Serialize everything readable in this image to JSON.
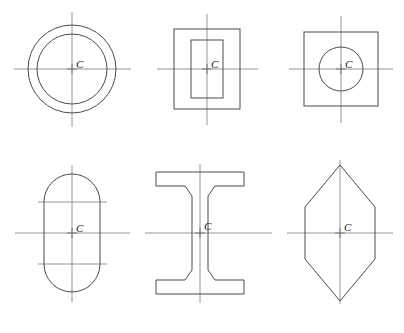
{
  "figure": {
    "background_color": "#ffffff",
    "outline_color": "#4a4a4a",
    "centerline_color": "#8a8a8a",
    "label_color": "#1a1a1a",
    "width": 404,
    "height": 333,
    "rows": 2,
    "columns": 3
  },
  "shapes": [
    {
      "id": "annulus",
      "name": "Hollow circle (annulus)",
      "centroid_label": "C",
      "center": {
        "x": 72,
        "y": 69
      },
      "outer_radius": 44,
      "inner_radius": 35,
      "label_offset": {
        "x": 4,
        "y": -1
      },
      "centerlines": {
        "horizontal": [
          {
            "x1": 14,
            "x2": 131,
            "y": 69
          }
        ],
        "vertical": [
          {
            "y1": 12,
            "y2": 127,
            "x": 72
          }
        ]
      }
    },
    {
      "id": "hollow-rectangle",
      "name": "Hollow rectangular tube",
      "centroid_label": "C",
      "center": {
        "x": 207,
        "y": 69
      },
      "outer_width": 66,
      "outer_height": 80,
      "inner_width": 32,
      "inner_height": 58,
      "label_offset": {
        "x": 4,
        "y": -1
      },
      "centerlines": {
        "horizontal": [
          {
            "x1": 157,
            "x2": 258,
            "y": 69
          }
        ],
        "vertical": [
          {
            "y1": 14,
            "y2": 125,
            "x": 207
          }
        ]
      }
    },
    {
      "id": "square-with-hole",
      "name": "Square with central circular hole",
      "centroid_label": "C",
      "center": {
        "x": 341,
        "y": 69
      },
      "square_size": 74,
      "hole_radius": 22,
      "label_offset": {
        "x": 4,
        "y": -1
      },
      "centerlines": {
        "horizontal": [
          {
            "x1": 289,
            "x2": 393,
            "y": 69
          }
        ],
        "vertical": [
          {
            "y1": 16,
            "y2": 123,
            "x": 341
          }
        ]
      }
    },
    {
      "id": "stadium",
      "name": "Obround (stadium) section",
      "centroid_label": "C",
      "center": {
        "x": 72,
        "y": 233
      },
      "body_width": 56,
      "body_height": 118,
      "corner_radius": 28,
      "label_offset": {
        "x": 4,
        "y": -1
      },
      "centerlines": {
        "horizontal": [
          {
            "x1": 15,
            "x2": 130,
            "y": 233
          },
          {
            "x1": 38,
            "x2": 107,
            "y": 202
          },
          {
            "x1": 38,
            "x2": 107,
            "y": 264
          }
        ],
        "vertical": [
          {
            "y1": 165,
            "y2": 302,
            "x": 72
          }
        ]
      }
    },
    {
      "id": "i-beam",
      "name": "Wide-flange I-beam section",
      "centroid_label": "C",
      "center": {
        "x": 200,
        "y": 233
      },
      "flange_width": 88,
      "flange_thickness": 14,
      "web_thickness": 15,
      "total_height": 122,
      "fillet": 7,
      "label_offset": {
        "x": 4,
        "y": -1
      },
      "centerlines": {
        "horizontal": [
          {
            "x1": 145,
            "x2": 272,
            "y": 233
          }
        ],
        "vertical": [
          {
            "y1": 164,
            "y2": 303,
            "x": 200
          }
        ]
      }
    },
    {
      "id": "hexagon",
      "name": "Elongated hexagon section",
      "centroid_label": "C",
      "center": {
        "x": 340,
        "y": 233
      },
      "half_width": 35,
      "half_height": 68,
      "straight_side_half_height": 26,
      "label_offset": {
        "x": 4,
        "y": -2
      },
      "centerlines": {
        "horizontal": [
          {
            "x1": 287,
            "x2": 393,
            "y": 233
          }
        ],
        "vertical": [
          {
            "y1": 160,
            "y2": 304,
            "x": 340
          }
        ]
      }
    }
  ],
  "center_mark": {
    "arm_length": 5,
    "description": "small cross at centroid"
  }
}
